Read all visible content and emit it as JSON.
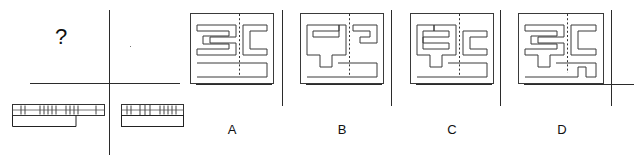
{
  "figure": {
    "type": "multiple-choice-spatial-reasoning",
    "prompt_symbol": "?",
    "question_cell": {
      "label": "?",
      "description": "empty answer cell with question mark"
    },
    "given_figures": [
      {
        "name": "given-figure-left",
        "description": "long horizontal bar with hatched/dotted upper band and a plain lower step block",
        "segments": [
          "hatched",
          "gap",
          "hatched",
          "gap",
          "hatched",
          "gap",
          "hatched"
        ],
        "tick_groups": [
          2,
          5,
          4,
          1
        ]
      },
      {
        "name": "given-figure-right",
        "description": "shorter horizontal bar with hatched upper band, solid vertical bars and a plain lower block",
        "segments": [
          "hatched",
          "bars",
          "hatched"
        ],
        "tick_groups": [
          2,
          3,
          5
        ]
      }
    ],
    "options": [
      {
        "id": "A",
        "label": "A",
        "name": "option-a",
        "description": "maze cross-section with S-shaped left channel and C-shaped right channel, dashed centre seam, wide open lower chamber"
      },
      {
        "id": "B",
        "label": "B",
        "name": "option-b",
        "description": "maze cross-section with Z-shaped left channel with downward stub and small hook on the right, dashed centre seam"
      },
      {
        "id": "C",
        "label": "C",
        "name": "option-c",
        "description": "maze cross-section with E-shaped left channel plus stub, C-shaped right channel, dashed centre seam"
      },
      {
        "id": "D",
        "label": "D",
        "name": "option-d",
        "description": "maze cross-section with S-shaped left channel plus stub and hooked right channel with notch, dashed centre seam"
      }
    ],
    "colors": {
      "stroke": "#3a3a3a",
      "text": "#111111",
      "background": "#ffffff",
      "divider": "#2b2b2b"
    }
  }
}
